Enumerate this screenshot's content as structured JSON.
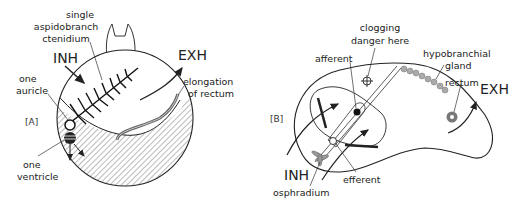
{
  "panel_a": {
    "tag": "[A]",
    "labels": {
      "ctenidium_1": "single",
      "ctenidium_2": "aspidobranch",
      "ctenidium_3": "ctenidium",
      "inh": "INH",
      "exh": "EXH",
      "auricle_1": "one",
      "auricle_2": "auricle",
      "rectum_1": "elongation",
      "rectum_2": "of rectum",
      "ventricle_1": "one",
      "ventricle_2": "ventricle"
    }
  },
  "panel_b": {
    "tag": "[B]",
    "labels": {
      "clog_1": "clogging",
      "clog_2": "danger here",
      "afferent": "afferent",
      "hypo_1": "hypobranchial",
      "hypo_2": "gland",
      "rectum": "rectum",
      "exh": "EXH",
      "inh": "INH",
      "efferent": "efferent",
      "osphradium": "osphradium"
    }
  },
  "colors": {
    "ink": "#222222",
    "shade": "#9a9a9a",
    "background": "#ffffff"
  }
}
